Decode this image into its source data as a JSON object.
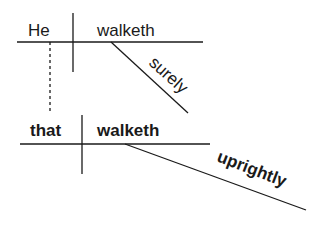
{
  "diagram": {
    "type": "sentence-diagram",
    "clause1": {
      "subject": "He",
      "verb": "walketh",
      "modifier": "surely"
    },
    "clause2": {
      "subject": "that",
      "verb": "walketh",
      "modifier": "uprightly"
    },
    "colors": {
      "line": "#1a1a1a",
      "background": "#ffffff"
    }
  }
}
